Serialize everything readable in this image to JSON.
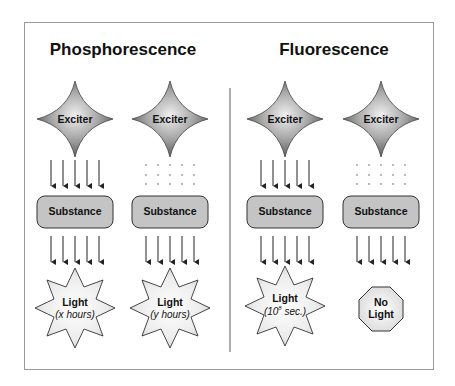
{
  "headings": {
    "left": "Phosphorescence",
    "right": "Fluorescence"
  },
  "columns": [
    {
      "group": "Phosphorescence",
      "exciter_label": "Exciter",
      "exciter_to_substance": "arrows",
      "substance_label": "Substance",
      "substance_to_output": "arrows",
      "output_shape": "star",
      "output_label": "Light",
      "output_sublabel_pre": "(x hours)",
      "output_sup": "",
      "output_sublabel_post": ""
    },
    {
      "group": "Phosphorescence",
      "exciter_label": "Exciter",
      "exciter_to_substance": "dots",
      "substance_label": "Substance",
      "substance_to_output": "arrows",
      "output_shape": "star",
      "output_label": "Light",
      "output_sublabel_pre": "(y hours)",
      "output_sup": "",
      "output_sublabel_post": ""
    },
    {
      "group": "Fluorescence",
      "exciter_label": "Exciter",
      "exciter_to_substance": "arrows",
      "substance_label": "Substance",
      "substance_to_output": "arrows",
      "output_shape": "star",
      "output_label": "Light",
      "output_sublabel_pre": "(10",
      "output_sup": "8",
      "output_sublabel_post": " sec.)"
    },
    {
      "group": "Fluorescence",
      "exciter_label": "Exciter",
      "exciter_to_substance": "dots",
      "substance_label": "Substance",
      "substance_to_output": "arrows",
      "output_shape": "octagon",
      "output_label": "No Light",
      "output_label_line1": "No",
      "output_label_line2": "Light"
    }
  ],
  "colors": {
    "frame": "#9a9a9a",
    "divider": "#777777",
    "exciter_fill_light": "#e8e8e8",
    "exciter_fill_dark": "#6e6e6e",
    "substance_fill": "#c4c4c4",
    "light_fill": "#f4f4f4",
    "stroke": "#333333"
  }
}
